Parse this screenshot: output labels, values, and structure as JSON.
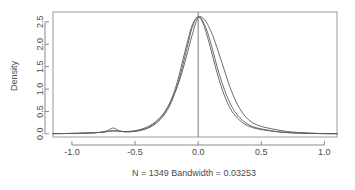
{
  "chart_data": {
    "type": "line",
    "title": "",
    "subtitle": "",
    "xlabel": "N = 1349   Bandwidth = 0.03253",
    "ylabel": "Density",
    "xlim": [
      -1.15,
      1.1
    ],
    "ylim": [
      -0.07,
      2.72
    ],
    "grid": false,
    "legend": "none",
    "xticks": [
      -1.0,
      -0.5,
      0.0,
      0.5,
      1.0
    ],
    "xtick_labels": [
      "-1.0",
      "-0.5",
      "0.0",
      "0.5",
      "1.0"
    ],
    "yticks": [
      0.0,
      0.5,
      1.0,
      1.5,
      2.0,
      2.5
    ],
    "ytick_labels": [
      "0.0",
      "0.5",
      "1.0",
      "1.5",
      "2.0",
      "2.5"
    ],
    "annotations": [
      {
        "kind": "vertical-reference-line",
        "x": 0.0,
        "label": ""
      }
    ],
    "series": [
      {
        "name": "density-curve-1",
        "color": "#5a5a5a",
        "x": [
          -1.15,
          -1.05,
          -0.95,
          -0.88,
          -0.82,
          -0.76,
          -0.72,
          -0.7,
          -0.68,
          -0.66,
          -0.64,
          -0.62,
          -0.58,
          -0.54,
          -0.5,
          -0.46,
          -0.42,
          -0.38,
          -0.34,
          -0.3,
          -0.26,
          -0.22,
          -0.18,
          -0.15,
          -0.12,
          -0.09,
          -0.06,
          -0.04,
          -0.02,
          0.0,
          0.015,
          0.03,
          0.05,
          0.07,
          0.09,
          0.12,
          0.15,
          0.18,
          0.21,
          0.25,
          0.29,
          0.33,
          0.37,
          0.41,
          0.45,
          0.49,
          0.53,
          0.58,
          0.63,
          0.7,
          0.78,
          0.86,
          0.95,
          1.05,
          1.1
        ],
        "y": [
          0.005,
          0.008,
          0.012,
          0.018,
          0.025,
          0.04,
          0.07,
          0.1,
          0.13,
          0.12,
          0.09,
          0.065,
          0.045,
          0.045,
          0.055,
          0.075,
          0.105,
          0.15,
          0.22,
          0.32,
          0.46,
          0.66,
          0.95,
          1.22,
          1.55,
          1.9,
          2.25,
          2.43,
          2.56,
          2.61,
          2.6,
          2.55,
          2.44,
          2.3,
          2.12,
          1.82,
          1.5,
          1.22,
          0.97,
          0.7,
          0.5,
          0.36,
          0.26,
          0.19,
          0.145,
          0.115,
          0.095,
          0.07,
          0.05,
          0.032,
          0.02,
          0.013,
          0.008,
          0.005,
          0.004
        ]
      },
      {
        "name": "density-curve-2",
        "color": "#5a5a5a",
        "x": [
          -1.15,
          -1.05,
          -0.95,
          -0.88,
          -0.82,
          -0.76,
          -0.72,
          -0.7,
          -0.68,
          -0.66,
          -0.64,
          -0.62,
          -0.58,
          -0.54,
          -0.5,
          -0.46,
          -0.42,
          -0.38,
          -0.34,
          -0.3,
          -0.26,
          -0.22,
          -0.18,
          -0.15,
          -0.12,
          -0.09,
          -0.06,
          -0.04,
          -0.02,
          0.0,
          0.015,
          0.03,
          0.05,
          0.07,
          0.09,
          0.12,
          0.15,
          0.18,
          0.21,
          0.25,
          0.29,
          0.33,
          0.37,
          0.41,
          0.45,
          0.49,
          0.53,
          0.58,
          0.63,
          0.7,
          0.78,
          0.86,
          0.95,
          1.05,
          1.1
        ],
        "y": [
          0.005,
          0.008,
          0.012,
          0.018,
          0.026,
          0.038,
          0.055,
          0.065,
          0.07,
          0.07,
          0.065,
          0.06,
          0.05,
          0.05,
          0.06,
          0.08,
          0.115,
          0.165,
          0.24,
          0.35,
          0.5,
          0.72,
          1.02,
          1.32,
          1.66,
          2.0,
          2.32,
          2.47,
          2.57,
          2.61,
          2.59,
          2.52,
          2.38,
          2.2,
          2.0,
          1.68,
          1.36,
          1.08,
          0.84,
          0.59,
          0.42,
          0.3,
          0.215,
          0.16,
          0.125,
          0.1,
          0.082,
          0.062,
          0.045,
          0.028,
          0.018,
          0.012,
          0.007,
          0.004,
          0.004
        ]
      },
      {
        "name": "density-curve-3",
        "color": "#5a5a5a",
        "x": [
          -1.15,
          -1.05,
          -0.95,
          -0.88,
          -0.82,
          -0.76,
          -0.72,
          -0.7,
          -0.68,
          -0.66,
          -0.64,
          -0.62,
          -0.58,
          -0.54,
          -0.5,
          -0.46,
          -0.42,
          -0.38,
          -0.34,
          -0.3,
          -0.26,
          -0.22,
          -0.18,
          -0.15,
          -0.12,
          -0.09,
          -0.06,
          -0.04,
          -0.02,
          0.0,
          0.015,
          0.03,
          0.05,
          0.07,
          0.09,
          0.12,
          0.15,
          0.18,
          0.21,
          0.25,
          0.29,
          0.33,
          0.37,
          0.41,
          0.45,
          0.49,
          0.53,
          0.58,
          0.63,
          0.7,
          0.78,
          0.86,
          0.95,
          1.05,
          1.1
        ],
        "y": [
          0.005,
          0.008,
          0.012,
          0.018,
          0.025,
          0.036,
          0.05,
          0.058,
          0.062,
          0.062,
          0.058,
          0.055,
          0.05,
          0.055,
          0.07,
          0.095,
          0.135,
          0.19,
          0.265,
          0.37,
          0.51,
          0.7,
          0.95,
          1.18,
          1.45,
          1.76,
          2.08,
          2.28,
          2.47,
          2.6,
          2.62,
          2.6,
          2.55,
          2.47,
          2.36,
          2.16,
          1.92,
          1.66,
          1.4,
          1.06,
          0.78,
          0.56,
          0.4,
          0.29,
          0.22,
          0.175,
          0.145,
          0.115,
          0.088,
          0.055,
          0.032,
          0.019,
          0.01,
          0.005,
          0.004
        ]
      }
    ]
  },
  "axes": {
    "ylabel": "Density",
    "xlabel": "N = 1349   Bandwidth = 0.03253"
  }
}
